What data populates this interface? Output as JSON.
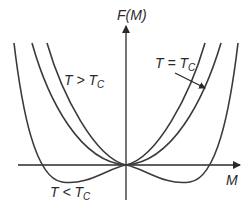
{
  "diagram": {
    "y_axis_label": "F(M)",
    "x_axis_label": "M",
    "curves": [
      {
        "name": "T > Tc",
        "label_main": "T > T",
        "label_sub": "C",
        "shape": "single minimum at M=0"
      },
      {
        "name": "T = Tc",
        "label_main": "T = T",
        "label_sub": "C",
        "shape": "flat quartic minimum at M=0"
      },
      {
        "name": "T < Tc",
        "label_main": "T < T",
        "label_sub": "C",
        "shape": "double well, two minima at ±M0"
      }
    ],
    "colors": {
      "line": "#3a3a3a",
      "background": "#ffffff"
    }
  }
}
